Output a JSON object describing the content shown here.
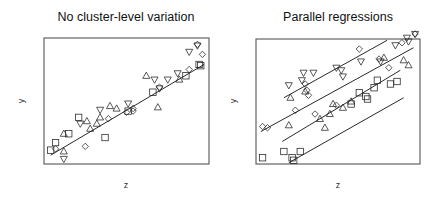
{
  "chart_data": [
    {
      "type": "scatter",
      "title": "No cluster-level variation",
      "xlabel": "z",
      "ylabel": "y",
      "xlim": [
        0,
        100
      ],
      "ylim": [
        0,
        100
      ],
      "grid": false,
      "legend": null,
      "axes_ticks": false,
      "frame_px": {
        "x0": 44,
        "y0": 38,
        "x1": 209,
        "y1": 164
      },
      "series": [
        {
          "name": "cluster-square",
          "marker": "square",
          "points": [
            [
              4,
              11
            ],
            [
              7,
              17
            ],
            [
              15,
              24
            ],
            [
              21,
              37
            ],
            [
              37,
              21
            ],
            [
              66,
              57
            ],
            [
              86,
              70
            ],
            [
              94,
              79
            ],
            [
              95,
              78
            ],
            [
              51,
              42
            ]
          ]
        },
        {
          "name": "cluster-triangle",
          "marker": "triangle-up",
          "points": [
            [
              12,
              24
            ],
            [
              12,
              10
            ],
            [
              26,
              34
            ],
            [
              32,
              32
            ],
            [
              40,
              46
            ],
            [
              44,
              44
            ],
            [
              62,
              70
            ],
            [
              69,
              45
            ],
            [
              82,
              67
            ],
            [
              34,
              37
            ],
            [
              28,
              28
            ]
          ]
        },
        {
          "name": "cluster-triangle-down",
          "marker": "triangle-down",
          "points": [
            [
              12,
              4
            ],
            [
              22,
              32
            ],
            [
              34,
              43
            ],
            [
              51,
              48
            ],
            [
              67,
              67
            ],
            [
              75,
              67
            ],
            [
              81,
              72
            ],
            [
              88,
              89
            ],
            [
              93,
              94
            ],
            [
              70,
              60
            ]
          ]
        },
        {
          "name": "cluster-diamond",
          "marker": "diamond",
          "points": [
            [
              25,
              14
            ],
            [
              39,
              36
            ],
            [
              50,
              41
            ],
            [
              54,
              44
            ],
            [
              70,
              61
            ],
            [
              88,
              75
            ],
            [
              96,
              87
            ],
            [
              93,
              95
            ],
            [
              7,
              12
            ],
            [
              54,
              42
            ]
          ]
        }
      ],
      "lines": [
        {
          "name": "pooled-regression",
          "from": [
            4,
            7
          ],
          "to": [
            97,
            79
          ]
        }
      ]
    },
    {
      "type": "scatter",
      "title": "Parallel regressions",
      "xlabel": "z",
      "ylabel": "y",
      "xlim": [
        0,
        100
      ],
      "ylim": [
        0,
        100
      ],
      "grid": false,
      "legend": null,
      "axes_ticks": false,
      "frame_px": {
        "x0": 256,
        "y0": 39,
        "x1": 420,
        "y1": 164
      },
      "series": [
        {
          "name": "cluster-square",
          "marker": "square",
          "points": [
            [
              4,
              5
            ],
            [
              17,
              10
            ],
            [
              22,
              5
            ],
            [
              27,
              10
            ],
            [
              74,
              67
            ],
            [
              72,
              61
            ],
            [
              82,
              64
            ],
            [
              58,
              48
            ],
            [
              63,
              57
            ],
            [
              67,
              54
            ],
            [
              86,
              66
            ],
            [
              68,
              52
            ],
            [
              23,
              3
            ]
          ]
        },
        {
          "name": "cluster-triangle",
          "marker": "triangle-up",
          "points": [
            [
              20,
              31
            ],
            [
              21,
              53
            ],
            [
              39,
              36
            ],
            [
              42,
              29
            ],
            [
              47,
              48
            ],
            [
              58,
              50
            ],
            [
              78,
              85
            ],
            [
              93,
              79
            ],
            [
              90,
              83
            ],
            [
              30,
              58
            ],
            [
              53,
              45
            ],
            [
              45,
              40
            ]
          ]
        },
        {
          "name": "cluster-triangle-down",
          "marker": "triangle-down",
          "points": [
            [
              20,
              63
            ],
            [
              28,
              67
            ],
            [
              35,
              73
            ],
            [
              49,
              77
            ],
            [
              52,
              75
            ],
            [
              76,
              82
            ],
            [
              85,
              95
            ],
            [
              92,
              101
            ],
            [
              93,
              98
            ],
            [
              64,
              82
            ],
            [
              97,
              104
            ],
            [
              29,
              73
            ],
            [
              53,
              70
            ]
          ]
        },
        {
          "name": "cluster-diamond",
          "marker": "diamond",
          "points": [
            [
              4,
              30
            ],
            [
              7,
              29
            ],
            [
              24,
              43
            ],
            [
              30,
              64
            ],
            [
              31,
              59
            ],
            [
              32,
              55
            ],
            [
              36,
              40
            ],
            [
              49,
              47
            ],
            [
              75,
              84
            ],
            [
              81,
              77
            ],
            [
              89,
              97
            ],
            [
              97,
              104
            ],
            [
              63,
              92
            ]
          ]
        }
      ],
      "lines": [
        {
          "name": "regression-cluster-1",
          "from": [
            17,
            53
          ],
          "to": [
            80,
            99
          ]
        },
        {
          "name": "regression-cluster-2",
          "from": [
            3,
            26
          ],
          "to": [
            96,
            93
          ]
        },
        {
          "name": "regression-cluster-3",
          "from": [
            16,
            18
          ],
          "to": [
            88,
            75
          ]
        },
        {
          "name": "regression-cluster-4",
          "from": [
            20,
            1
          ],
          "to": [
            90,
            53
          ]
        }
      ]
    }
  ],
  "panels": [
    {
      "title": "No cluster-level variation",
      "xlabel": "z",
      "ylabel": "y"
    },
    {
      "title": "Parallel regressions",
      "xlabel": "z",
      "ylabel": "y"
    }
  ]
}
